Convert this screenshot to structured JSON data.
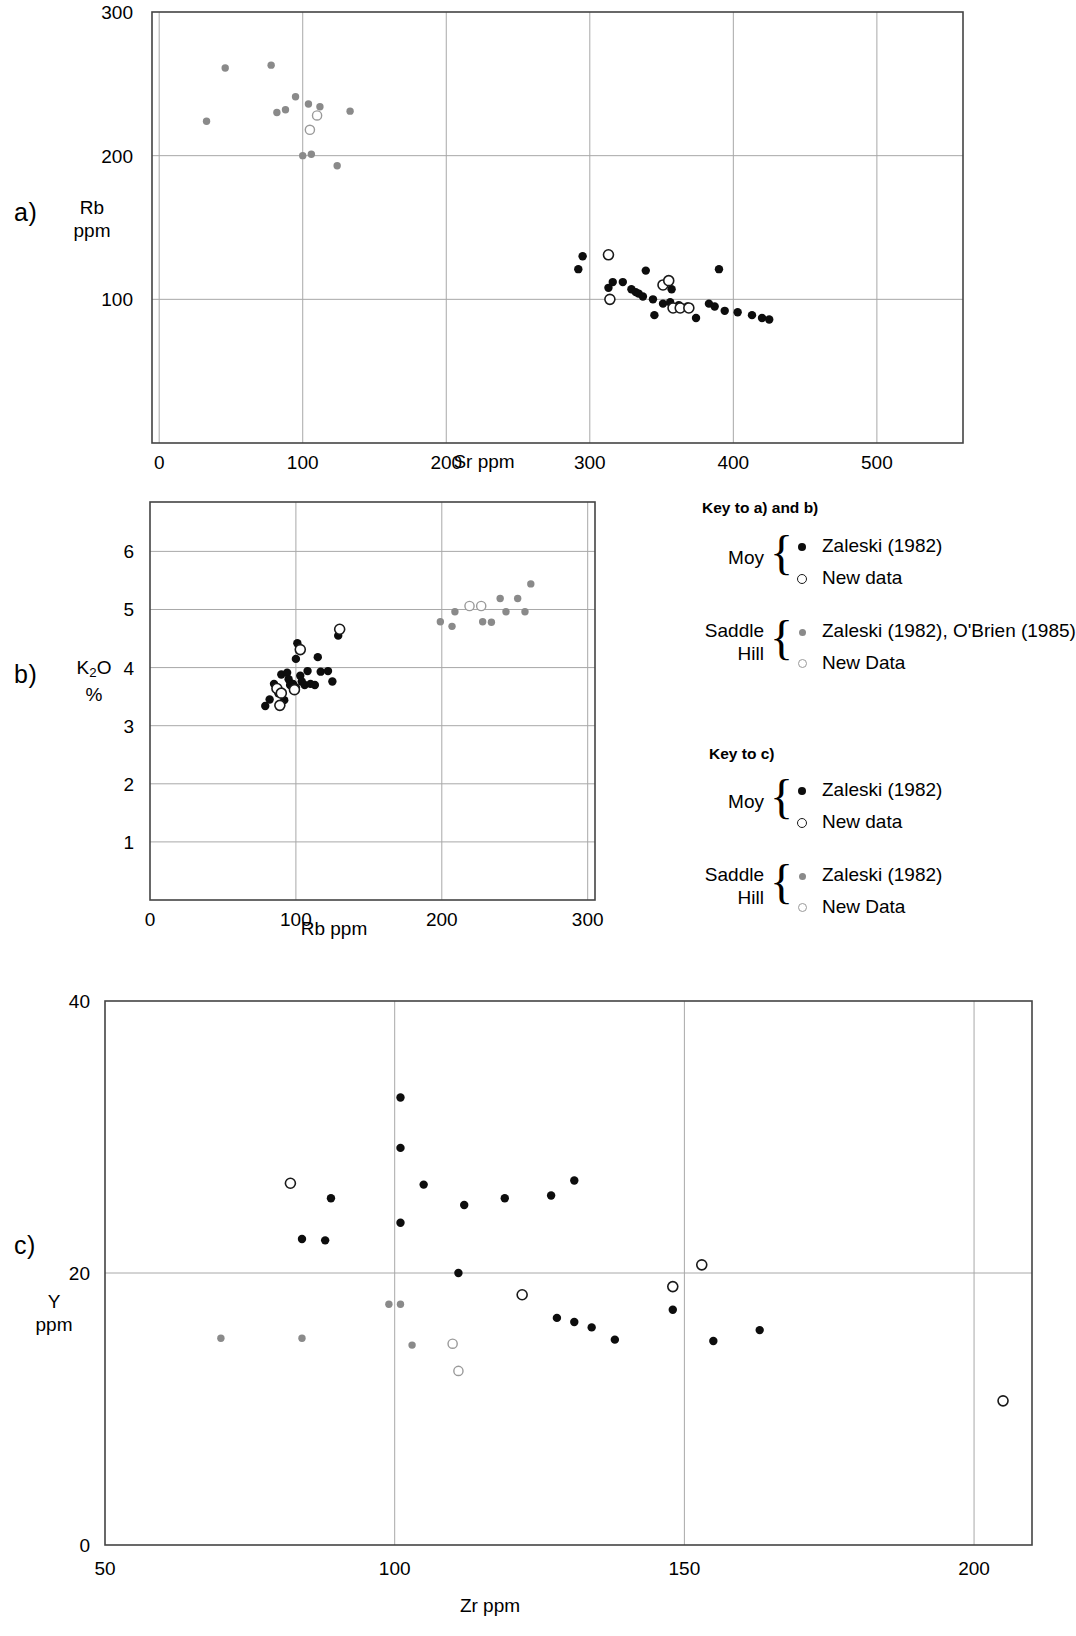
{
  "panels": {
    "a": {
      "label": "a)"
    },
    "b": {
      "label": "b)"
    },
    "c": {
      "label": "c)"
    }
  },
  "legend_a_b": {
    "title": "Key to a) and b)",
    "groups": [
      {
        "name_line1": "Moy",
        "name_line2": "",
        "entries": [
          {
            "symbol": "filled-black-circle",
            "label": "Zaleski (1982)"
          },
          {
            "symbol": "open-black-circle",
            "label": "New data"
          }
        ]
      },
      {
        "name_line1": "Saddle",
        "name_line2": "Hill",
        "entries": [
          {
            "symbol": "filled-grey-circle",
            "label": "Zaleski (1982), O'Brien (1985)"
          },
          {
            "symbol": "open-grey-circle",
            "label": "New Data"
          }
        ]
      }
    ]
  },
  "legend_c": {
    "title": "Key to c)",
    "groups": [
      {
        "name_line1": "Moy",
        "name_line2": "",
        "entries": [
          {
            "symbol": "filled-black-circle",
            "label": "Zaleski (1982)"
          },
          {
            "symbol": "open-black-circle",
            "label": "New data"
          }
        ]
      },
      {
        "name_line1": "Saddle",
        "name_line2": "Hill",
        "entries": [
          {
            "symbol": "filled-grey-circle",
            "label": "Zaleski (1982)"
          },
          {
            "symbol": "open-grey-circle",
            "label": "New Data"
          }
        ]
      }
    ]
  },
  "colors": {
    "moy_filled": "#0d0d0d",
    "moy_open_stroke": "#1a1a1a",
    "saddle_filled": "#8a8a8a",
    "saddle_open_stroke": "#9a9a9a",
    "grid": "#a8a8a8",
    "frame": "#444444"
  },
  "chart_data": [
    {
      "id": "a",
      "type": "scatter",
      "title": "",
      "xlabel": "Sr  ppm",
      "ylabel": "Rb\nppm",
      "ylabel_line1": "Rb",
      "ylabel_line2": "ppm",
      "xlim": [
        -5,
        560
      ],
      "ylim": [
        0,
        300
      ],
      "xticks": [
        0,
        100,
        200,
        300,
        400,
        500
      ],
      "yticks": [
        100,
        200,
        300
      ],
      "xticklabels": [
        "0",
        "100",
        "200",
        "300",
        "400",
        "500"
      ],
      "yticklabels": [
        "100",
        "200",
        "300"
      ],
      "grid": true,
      "series": [
        {
          "name": "Moy Zaleski (1982)",
          "symbol": "filled-black-circle",
          "points": [
            [
              295,
              130
            ],
            [
              292,
              121
            ],
            [
              313,
              108
            ],
            [
              316,
              112
            ],
            [
              323,
              112
            ],
            [
              329,
              107
            ],
            [
              332,
              105
            ],
            [
              334,
              104
            ],
            [
              337,
              102
            ],
            [
              339,
              120
            ],
            [
              344,
              100
            ],
            [
              345,
              89
            ],
            [
              351,
              97
            ],
            [
              356,
              98
            ],
            [
              357,
              107
            ],
            [
              362,
              96
            ],
            [
              368,
              95
            ],
            [
              374,
              87
            ],
            [
              383,
              97
            ],
            [
              387,
              95
            ],
            [
              390,
              121
            ],
            [
              394,
              92
            ],
            [
              403,
              91
            ],
            [
              413,
              89
            ],
            [
              420,
              87
            ],
            [
              425,
              86
            ]
          ]
        },
        {
          "name": "Moy New data",
          "symbol": "open-black-circle",
          "points": [
            [
              313,
              131
            ],
            [
              314,
              100
            ],
            [
              351,
              110
            ],
            [
              355,
              113
            ],
            [
              358,
              94
            ],
            [
              363,
              94
            ],
            [
              369,
              94
            ]
          ]
        },
        {
          "name": "Saddle Hill Zaleski (1982), O'Brien (1985)",
          "symbol": "filled-grey-circle",
          "points": [
            [
              33,
              224
            ],
            [
              46,
              261
            ],
            [
              78,
              263
            ],
            [
              82,
              230
            ],
            [
              88,
              232
            ],
            [
              95,
              241
            ],
            [
              100,
              200
            ],
            [
              104,
              236
            ],
            [
              106,
              201
            ],
            [
              112,
              234
            ],
            [
              124,
              193
            ],
            [
              133,
              231
            ]
          ]
        },
        {
          "name": "Saddle Hill New Data",
          "symbol": "open-grey-circle",
          "points": [
            [
              105,
              218
            ],
            [
              110,
              228
            ]
          ]
        }
      ]
    },
    {
      "id": "b",
      "type": "scatter",
      "title": "",
      "xlabel": "Rb ppm",
      "ylabel_line1": "K₂O",
      "ylabel_line2": "%",
      "xlim": [
        0,
        305
      ],
      "ylim": [
        0,
        6.85
      ],
      "xticks": [
        0,
        100,
        200,
        300
      ],
      "yticks": [
        1,
        2,
        3,
        4,
        5,
        6
      ],
      "xticklabels": [
        "0",
        "100",
        "200",
        "300"
      ],
      "yticklabels": [
        "1",
        "2",
        "3",
        "4",
        "5",
        "6"
      ],
      "grid": true,
      "series": [
        {
          "name": "Moy Zaleski (1982)",
          "symbol": "filled-black-circle",
          "points": [
            [
              79,
              3.34
            ],
            [
              82,
              3.45
            ],
            [
              85,
              3.72
            ],
            [
              88,
              3.62
            ],
            [
              88,
              3.56
            ],
            [
              90,
              3.88
            ],
            [
              92,
              3.44
            ],
            [
              94,
              3.91
            ],
            [
              95,
              3.8
            ],
            [
              96,
              3.7
            ],
            [
              98,
              3.72
            ],
            [
              100,
              3.66
            ],
            [
              100,
              4.15
            ],
            [
              101,
              4.42
            ],
            [
              103,
              3.86
            ],
            [
              104,
              3.76
            ],
            [
              106,
              3.7
            ],
            [
              108,
              3.94
            ],
            [
              110,
              3.72
            ],
            [
              113,
              3.7
            ],
            [
              115,
              4.18
            ],
            [
              117,
              3.93
            ],
            [
              122,
              3.94
            ],
            [
              125,
              3.76
            ],
            [
              129,
              4.55
            ]
          ]
        },
        {
          "name": "Moy New data",
          "symbol": "open-black-circle",
          "points": [
            [
              87,
              3.64
            ],
            [
              89,
              3.35
            ],
            [
              90,
              3.56
            ],
            [
              99,
              3.62
            ],
            [
              103,
              4.31
            ],
            [
              130,
              4.66
            ]
          ]
        },
        {
          "name": "Saddle Hill Zaleski (1982), O'Brien (1985)",
          "symbol": "filled-grey-circle",
          "points": [
            [
              199,
              4.79
            ],
            [
              207,
              4.71
            ],
            [
              209,
              4.96
            ],
            [
              228,
              4.79
            ],
            [
              234,
              4.78
            ],
            [
              240,
              5.19
            ],
            [
              244,
              4.96
            ],
            [
              252,
              5.19
            ],
            [
              257,
              4.96
            ],
            [
              261,
              5.44
            ]
          ]
        },
        {
          "name": "Saddle Hill New Data",
          "symbol": "open-grey-circle",
          "points": [
            [
              219,
              5.06
            ],
            [
              227,
              5.06
            ]
          ]
        }
      ]
    },
    {
      "id": "c",
      "type": "scatter",
      "title": "",
      "xlabel": "Zr ppm",
      "ylabel_line1": "Y",
      "ylabel_line2": "ppm",
      "xlim": [
        50,
        210
      ],
      "ylim": [
        0,
        40
      ],
      "xticks": [
        50,
        100,
        150,
        200
      ],
      "yticks": [
        0,
        20,
        40
      ],
      "xticklabels": [
        "50",
        "100",
        "150",
        "200"
      ],
      "yticklabels": [
        "0",
        "20",
        "40"
      ],
      "grid": true,
      "series": [
        {
          "name": "Moy Zaleski (1982)",
          "symbol": "filled-black-circle",
          "points": [
            [
              84,
              22.5
            ],
            [
              88,
              22.4
            ],
            [
              89,
              25.5
            ],
            [
              101,
              32.9
            ],
            [
              101,
              29.2
            ],
            [
              101,
              23.7
            ],
            [
              105,
              26.5
            ],
            [
              111,
              20.0
            ],
            [
              112,
              25.0
            ],
            [
              119,
              25.5
            ],
            [
              127,
              25.7
            ],
            [
              131,
              26.8
            ],
            [
              128,
              16.7
            ],
            [
              131,
              16.4
            ],
            [
              134,
              16.0
            ],
            [
              138,
              15.1
            ],
            [
              148,
              17.3
            ],
            [
              163,
              15.8
            ],
            [
              155,
              15.0
            ]
          ]
        },
        {
          "name": "Moy New data",
          "symbol": "open-black-circle",
          "points": [
            [
              82,
              26.6
            ],
            [
              122,
              18.4
            ],
            [
              148,
              19.0
            ],
            [
              153,
              20.6
            ],
            [
              205,
              10.6
            ]
          ]
        },
        {
          "name": "Saddle Hill Zaleski (1982)",
          "symbol": "filled-grey-circle",
          "points": [
            [
              70,
              15.2
            ],
            [
              84,
              15.2
            ],
            [
              99,
              17.7
            ],
            [
              101,
              17.7
            ],
            [
              103,
              14.7
            ]
          ]
        },
        {
          "name": "Saddle Hill New Data",
          "symbol": "open-grey-circle",
          "points": [
            [
              110,
              14.8
            ],
            [
              111,
              12.8
            ]
          ]
        }
      ]
    }
  ]
}
